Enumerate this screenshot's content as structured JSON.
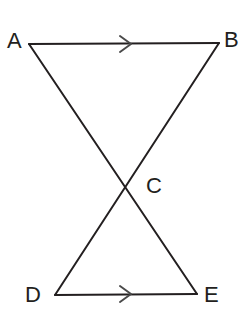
{
  "figure": {
    "background_color": "#ffffff",
    "line_color": "#231f20",
    "marker_color": "#4a4a4a",
    "width": 248,
    "height": 317,
    "vertices": [
      {
        "id": "A",
        "label": "A",
        "x": 29,
        "y": 44,
        "label_x": 7,
        "label_y": 48
      },
      {
        "id": "B",
        "label": "B",
        "x": 219,
        "y": 43,
        "label_x": 224,
        "label_y": 47
      },
      {
        "id": "C",
        "label": "C",
        "x": 124,
        "y": 186,
        "label_x": 146,
        "label_y": 193
      },
      {
        "id": "D",
        "label": "D",
        "x": 55,
        "y": 295,
        "label_x": 25,
        "label_y": 302
      },
      {
        "id": "E",
        "label": "E",
        "x": 197,
        "y": 294,
        "label_x": 204,
        "label_y": 302
      }
    ],
    "segments": [
      {
        "id": "AB",
        "from": "A",
        "to": "B",
        "name": "segment-ab",
        "marker": "single-chevron",
        "marker_x": 126,
        "marker_y": 44
      },
      {
        "id": "DE",
        "from": "D",
        "to": "E",
        "name": "segment-de",
        "marker": "single-chevron",
        "marker_x": 126,
        "marker_y": 294
      },
      {
        "id": "AE",
        "from": "A",
        "to": "E",
        "name": "segment-ae",
        "marker": "none"
      },
      {
        "id": "BD",
        "from": "B",
        "to": "D",
        "name": "segment-bd",
        "marker": "none"
      }
    ],
    "intersection": {
      "id": "C",
      "of": [
        "AE",
        "BD"
      ]
    },
    "parallel_marks": {
      "count": 2,
      "on_segments": [
        "AB",
        "DE"
      ],
      "glyph": "single-chevron"
    }
  }
}
